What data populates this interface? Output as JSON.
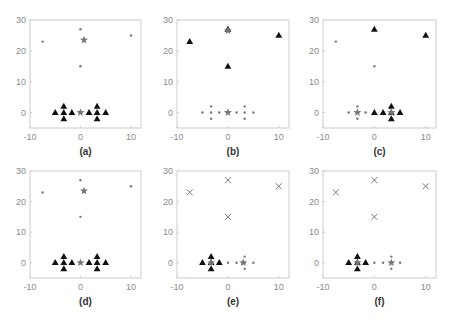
{
  "chart_data": [
    {
      "type": "scatter",
      "label": "(a)",
      "xlim": [
        -10,
        12
      ],
      "ylim": [
        -5,
        30
      ],
      "xticks": [
        -10,
        0,
        10
      ],
      "yticks": [
        0,
        10,
        20,
        30
      ],
      "series": [
        {
          "name": "cluster-dots",
          "marker": "dot",
          "points": [
            [
              -7.5,
              23
            ],
            [
              0,
              27
            ],
            [
              10,
              25
            ],
            [
              0,
              15
            ]
          ]
        },
        {
          "name": "cluster-triangles",
          "marker": "triangle",
          "points": [
            [
              -5,
              0
            ],
            [
              -3.3,
              2
            ],
            [
              -3.3,
              0
            ],
            [
              -3.3,
              -2
            ],
            [
              -1.7,
              0
            ],
            [
              1.7,
              0
            ],
            [
              3.3,
              2
            ],
            [
              3.3,
              0
            ],
            [
              3.3,
              -2
            ],
            [
              5,
              0
            ]
          ]
        },
        {
          "name": "centroids",
          "marker": "star",
          "points": [
            [
              0.7,
              23.5
            ],
            [
              0,
              0
            ]
          ]
        }
      ]
    },
    {
      "type": "scatter",
      "label": "(b)",
      "xlim": [
        -10,
        12
      ],
      "ylim": [
        -5,
        30
      ],
      "xticks": [
        -10,
        0,
        10
      ],
      "yticks": [
        0,
        10,
        20,
        30
      ],
      "series": [
        {
          "name": "cluster-triangles",
          "marker": "triangle",
          "points": [
            [
              -7.5,
              23
            ],
            [
              0,
              27
            ],
            [
              10,
              25
            ],
            [
              0,
              15
            ]
          ]
        },
        {
          "name": "cluster-dots",
          "marker": "dot",
          "points": [
            [
              -5,
              0
            ],
            [
              -3.3,
              2
            ],
            [
              -3.3,
              0
            ],
            [
              -3.3,
              -2
            ],
            [
              -1.7,
              0
            ],
            [
              1.7,
              0
            ],
            [
              3.3,
              2
            ],
            [
              3.3,
              0
            ],
            [
              3.3,
              -2
            ],
            [
              5,
              0
            ]
          ]
        },
        {
          "name": "centroids",
          "marker": "star",
          "points": [
            [
              0,
              26.5
            ],
            [
              0,
              0
            ]
          ]
        }
      ]
    },
    {
      "type": "scatter",
      "label": "(c)",
      "xlim": [
        -10,
        12
      ],
      "ylim": [
        -5,
        30
      ],
      "xticks": [
        -10,
        0,
        10
      ],
      "yticks": [
        0,
        10,
        20,
        30
      ],
      "series": [
        {
          "name": "cluster-dots",
          "marker": "dot",
          "points": [
            [
              -7.5,
              23
            ],
            [
              0,
              15
            ],
            [
              -5,
              0
            ],
            [
              -3.3,
              2
            ],
            [
              -3.3,
              0
            ],
            [
              -3.3,
              -2
            ],
            [
              -1.7,
              0
            ]
          ]
        },
        {
          "name": "cluster-triangles",
          "marker": "triangle",
          "points": [
            [
              0,
              27
            ],
            [
              10,
              25
            ],
            [
              0,
              0
            ],
            [
              1.7,
              0
            ],
            [
              3.3,
              2
            ],
            [
              3.3,
              0
            ],
            [
              3.3,
              -2
            ],
            [
              5,
              0
            ]
          ]
        },
        {
          "name": "centroids",
          "marker": "star",
          "points": [
            [
              -3.3,
              0
            ],
            [
              3.3,
              0
            ]
          ]
        }
      ]
    },
    {
      "type": "scatter",
      "label": "(d)",
      "xlim": [
        -10,
        12
      ],
      "ylim": [
        -5,
        30
      ],
      "xticks": [
        -10,
        0,
        10
      ],
      "yticks": [
        0,
        10,
        20,
        30
      ],
      "series": [
        {
          "name": "cluster-dots",
          "marker": "dot",
          "points": [
            [
              -7.5,
              23
            ],
            [
              0,
              27
            ],
            [
              10,
              25
            ],
            [
              0,
              15
            ]
          ]
        },
        {
          "name": "cluster-triangles",
          "marker": "triangle",
          "points": [
            [
              -5,
              0
            ],
            [
              -3.3,
              2
            ],
            [
              -3.3,
              0
            ],
            [
              -3.3,
              -2
            ],
            [
              -1.7,
              0
            ],
            [
              1.7,
              0
            ],
            [
              3.3,
              2
            ],
            [
              3.3,
              0
            ],
            [
              3.3,
              -2
            ],
            [
              5,
              0
            ]
          ]
        },
        {
          "name": "centroids",
          "marker": "star",
          "points": [
            [
              0.7,
              23.5
            ],
            [
              0,
              0
            ]
          ]
        }
      ]
    },
    {
      "type": "scatter",
      "label": "(e)",
      "xlim": [
        -10,
        12
      ],
      "ylim": [
        -5,
        30
      ],
      "xticks": [
        -10,
        0,
        10
      ],
      "yticks": [
        0,
        10,
        20,
        30
      ],
      "series": [
        {
          "name": "cluster-crosses",
          "marker": "cross",
          "points": [
            [
              -7.5,
              23
            ],
            [
              0,
              27
            ],
            [
              10,
              25
            ],
            [
              0,
              15
            ]
          ]
        },
        {
          "name": "cluster-triangles",
          "marker": "triangle",
          "points": [
            [
              -5,
              0
            ],
            [
              -3.3,
              2
            ],
            [
              -3.3,
              0
            ],
            [
              -3.3,
              -2
            ],
            [
              -1.7,
              0
            ]
          ]
        },
        {
          "name": "cluster-dots",
          "marker": "dot",
          "points": [
            [
              0,
              0
            ],
            [
              1.7,
              0
            ],
            [
              3.3,
              2
            ],
            [
              3.3,
              0
            ],
            [
              3.3,
              -2
            ],
            [
              5,
              0
            ]
          ]
        },
        {
          "name": "centroids",
          "marker": "star",
          "points": [
            [
              -3.3,
              0
            ],
            [
              3.0,
              0
            ]
          ]
        }
      ]
    },
    {
      "type": "scatter",
      "label": "(f)",
      "xlim": [
        -10,
        12
      ],
      "ylim": [
        -5,
        30
      ],
      "xticks": [
        -10,
        0,
        10
      ],
      "yticks": [
        0,
        10,
        20,
        30
      ],
      "series": [
        {
          "name": "cluster-crosses",
          "marker": "cross",
          "points": [
            [
              -7.5,
              23
            ],
            [
              0,
              27
            ],
            [
              10,
              25
            ],
            [
              0,
              15
            ]
          ]
        },
        {
          "name": "cluster-triangles",
          "marker": "triangle",
          "points": [
            [
              -5,
              0
            ],
            [
              -3.3,
              2
            ],
            [
              -3.3,
              0
            ],
            [
              -3.3,
              -2
            ],
            [
              -1.7,
              0
            ]
          ]
        },
        {
          "name": "cluster-dots",
          "marker": "dot",
          "points": [
            [
              0,
              0
            ],
            [
              1.7,
              0
            ],
            [
              3.3,
              2
            ],
            [
              3.3,
              0
            ],
            [
              3.3,
              -2
            ],
            [
              5,
              0
            ]
          ]
        },
        {
          "name": "centroids",
          "marker": "star",
          "points": [
            [
              -3.3,
              0
            ],
            [
              3.3,
              0
            ]
          ]
        }
      ]
    }
  ],
  "layout": {
    "panels": [
      {
        "left": 30,
        "top": 20,
        "width": 111,
        "height": 108
      },
      {
        "left": 177,
        "top": 20,
        "width": 112,
        "height": 108
      },
      {
        "left": 323,
        "top": 20,
        "width": 113,
        "height": 108
      },
      {
        "left": 30,
        "top": 171,
        "width": 111,
        "height": 107
      },
      {
        "left": 177,
        "top": 171,
        "width": 112,
        "height": 107
      },
      {
        "left": 323,
        "top": 171,
        "width": 113,
        "height": 107
      }
    ],
    "colors": {
      "axis": "#cccccc",
      "tick_text": "#8a8a8a",
      "marker_dark": "#111111",
      "marker_gray": "#777777",
      "caption": "#333333"
    }
  }
}
